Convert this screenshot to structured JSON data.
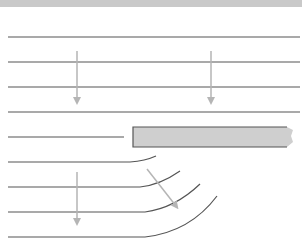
{
  "diagram": {
    "title": "",
    "colors": {
      "top_band": "#c9c9c9",
      "line": "#555555",
      "arrow": "#b5b5b5",
      "block_fill": "#cfcfcf",
      "block_stroke": "#555555"
    },
    "straight_lines": [
      {
        "id": "line-1",
        "kind": "full"
      },
      {
        "id": "line-2",
        "kind": "full"
      },
      {
        "id": "line-3",
        "kind": "full"
      },
      {
        "id": "line-4",
        "kind": "full"
      },
      {
        "id": "line-5",
        "kind": "ends-before-block"
      }
    ],
    "curved_lines": [
      {
        "id": "curve-1"
      },
      {
        "id": "curve-2"
      },
      {
        "id": "curve-3"
      },
      {
        "id": "curve-4"
      }
    ],
    "arrows": [
      {
        "id": "arrow-upper-left",
        "direction": "down"
      },
      {
        "id": "arrow-upper-right",
        "direction": "down"
      },
      {
        "id": "arrow-lower-left",
        "direction": "down"
      },
      {
        "id": "arrow-lower-diagonal",
        "direction": "down-right"
      }
    ],
    "block": {
      "id": "obstruction-block",
      "label": ""
    }
  }
}
